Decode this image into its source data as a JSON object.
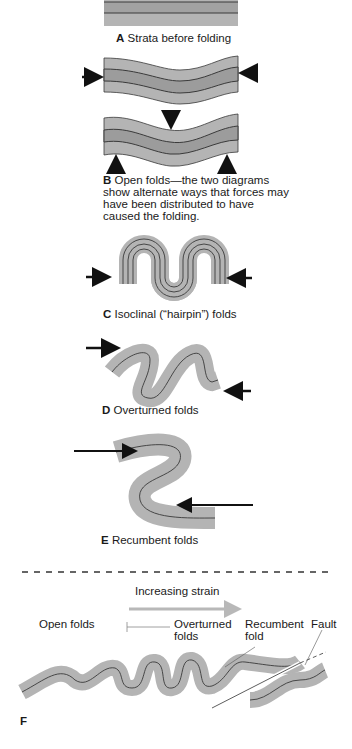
{
  "panels": {
    "A": {
      "letter": "A",
      "caption": "Strata before folding"
    },
    "B": {
      "letter": "B",
      "caption_lines": [
        "Open folds—the two diagrams",
        "show alternate ways that forces may",
        "have been distributed to have",
        "caused the folding."
      ]
    },
    "C": {
      "letter": "C",
      "caption": "Isoclinal (“hairpin”) folds"
    },
    "D": {
      "letter": "D",
      "caption": "Overturned folds"
    },
    "E": {
      "letter": "E",
      "caption": "Recumbent folds"
    },
    "F": {
      "letter": "F",
      "strain_label": "Increasing strain",
      "labels": {
        "open": "Open folds",
        "overturned_1": "Overturned",
        "overturned_2": "folds",
        "recumbent_1": "Recumbent",
        "recumbent_2": "fold",
        "fault": "Fault"
      }
    }
  },
  "colors": {
    "stratum_light": "#b4b4b4",
    "stratum_dark": "#9c9c9c",
    "line": "#3a3a3a",
    "strain_arrow": "#b8b8b8",
    "text": "#1a1a1a"
  }
}
